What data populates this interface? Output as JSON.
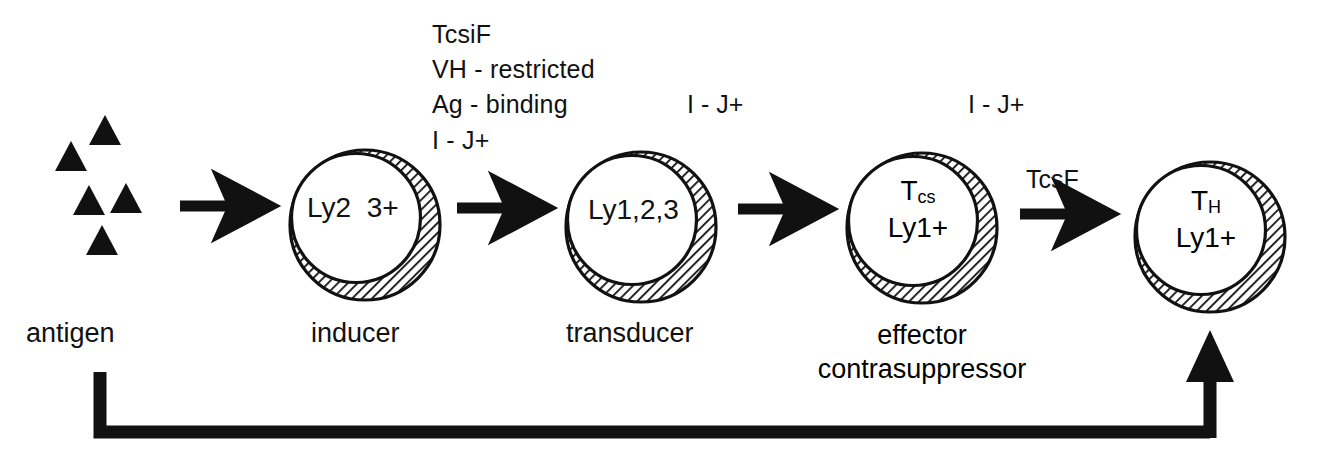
{
  "figure": {
    "type": "cell-pathway-diagram",
    "title": "",
    "colors": {
      "ink": "#000000",
      "background": "#ffffff",
      "hatch": "#1a1a1a"
    }
  },
  "antigen": {
    "name": "antigen",
    "caption": "antigen",
    "marker_shape": "triangle",
    "marker_count": 5,
    "markers": [
      {
        "x": 105,
        "y": 131
      },
      {
        "x": 71,
        "y": 157
      },
      {
        "x": 89,
        "y": 201
      },
      {
        "x": 126,
        "y": 199
      },
      {
        "x": 102,
        "y": 241
      }
    ]
  },
  "annotation_block": {
    "name": "inducer-annotations",
    "lines": [
      "TcsiF",
      "VH - restricted",
      "Ag - binding",
      "I - J+"
    ]
  },
  "cells": [
    {
      "id": "inducer",
      "caption": "inducer",
      "inner_lines": [
        {
          "text": "Ly2  3+",
          "sub": ""
        }
      ],
      "top_label": "",
      "cx": 365,
      "cy": 225,
      "r": 75
    },
    {
      "id": "transducer",
      "caption": "transducer",
      "inner_lines": [
        {
          "text": "Ly1,2,3",
          "sub": ""
        }
      ],
      "top_label": "I - J+",
      "cx": 641,
      "cy": 227,
      "r": 75
    },
    {
      "id": "effector-contrasuppressor",
      "caption": "effector\ncontrasuppressor",
      "caption_line1": "effector",
      "caption_line2": "contrasuppressor",
      "inner_lines": [
        {
          "text": "T",
          "sub": "cs"
        },
        {
          "text": "Ly1+",
          "sub": ""
        }
      ],
      "top_label": "I - J+",
      "cx": 922,
      "cy": 228,
      "r": 75
    },
    {
      "id": "t-helper",
      "caption": "",
      "inner_lines": [
        {
          "text": "T",
          "sub": "H"
        },
        {
          "text": "Ly1+",
          "sub": ""
        }
      ],
      "top_label": "",
      "cx": 1210,
      "cy": 237,
      "r": 75
    }
  ],
  "arrows": [
    {
      "id": "antigen-to-inducer",
      "label": "",
      "from": "antigen",
      "to": "inducer"
    },
    {
      "id": "inducer-to-transducer",
      "label": "",
      "from": "inducer",
      "to": "transducer"
    },
    {
      "id": "transducer-to-effector",
      "label": "",
      "from": "transducer",
      "to": "effector-contrasuppressor"
    },
    {
      "id": "effector-to-helper",
      "label": "TcsF",
      "from": "effector-contrasuppressor",
      "to": "t-helper"
    }
  ],
  "feedback_arrow": {
    "id": "feedback-loop",
    "label": "",
    "from": "antigen",
    "to": "t-helper",
    "direction": "up"
  }
}
